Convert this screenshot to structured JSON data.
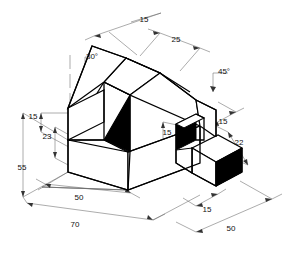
{
  "drawing": {
    "type": "isometric-technical-drawing",
    "title": "",
    "units": "mm",
    "background_color": "#ffffff",
    "line_color": "#000000",
    "dimension_line_color": "#555555",
    "shaded_face_color": "#000000",
    "dimensions": [
      {
        "id": "top-left-15",
        "label": "15",
        "x": 144,
        "y": 22,
        "anchor": "middle"
      },
      {
        "id": "top-right-25",
        "label": "25",
        "x": 176,
        "y": 42,
        "anchor": "middle"
      },
      {
        "id": "angle-30",
        "label": "30°",
        "x": 92,
        "y": 59,
        "anchor": "middle"
      },
      {
        "id": "angle-45",
        "label": "45°",
        "x": 224,
        "y": 74,
        "anchor": "middle"
      },
      {
        "id": "left-15",
        "label": "15",
        "x": 33,
        "y": 119,
        "anchor": "middle"
      },
      {
        "id": "left-23",
        "label": "23",
        "x": 47,
        "y": 139,
        "anchor": "middle"
      },
      {
        "id": "left-55",
        "label": "55",
        "x": 22,
        "y": 170,
        "anchor": "middle"
      },
      {
        "id": "mid-15",
        "label": "15",
        "x": 167,
        "y": 135,
        "anchor": "middle"
      },
      {
        "id": "right-15",
        "label": "15",
        "x": 223,
        "y": 124,
        "anchor": "middle"
      },
      {
        "id": "right-22",
        "label": "22",
        "x": 239,
        "y": 145,
        "anchor": "middle"
      },
      {
        "id": "bottom-left-50",
        "label": "50",
        "x": 79,
        "y": 200,
        "anchor": "middle"
      },
      {
        "id": "bottom-70",
        "label": "70",
        "x": 75,
        "y": 227,
        "anchor": "middle"
      },
      {
        "id": "bottom-right-15",
        "label": "15",
        "x": 207,
        "y": 212,
        "anchor": "middle"
      },
      {
        "id": "bottom-right-50",
        "label": "50",
        "x": 231,
        "y": 231,
        "anchor": "middle"
      }
    ]
  }
}
